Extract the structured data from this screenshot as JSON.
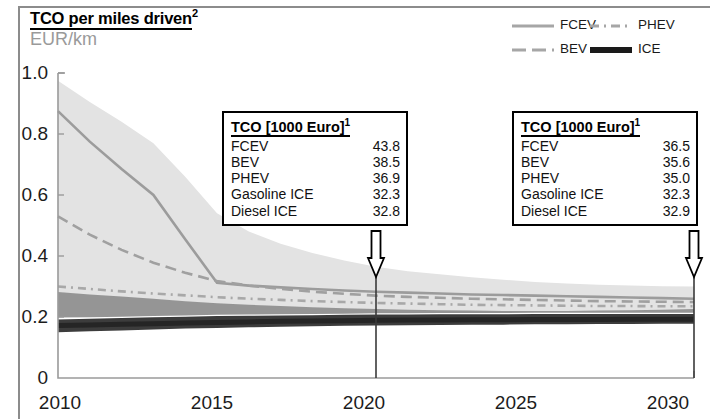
{
  "header": {
    "title": "TCO per miles driven",
    "title_superscript": "2",
    "subtitle": "EUR/km"
  },
  "legend": {
    "items": [
      {
        "label": "FCEV",
        "style": "solid",
        "color": "#a6a6a6",
        "icon": "line-solid-icon"
      },
      {
        "label": "PHEV",
        "style": "dash-dot",
        "color": "#a6a6a6",
        "icon": "line-dash-dot-icon"
      },
      {
        "label": "BEV",
        "style": "dashed",
        "color": "#a6a6a6",
        "icon": "line-dashed-icon"
      },
      {
        "label": "ICE",
        "style": "solid-thick",
        "color": "#1a1a1a",
        "icon": "line-thick-icon"
      }
    ]
  },
  "callouts": [
    {
      "id": "callout-2020",
      "title": "TCO [1000 Euro]",
      "title_superscript": "1",
      "year": 2020,
      "rows": [
        {
          "name": "FCEV",
          "value": "43.8"
        },
        {
          "name": "BEV",
          "value": "38.5"
        },
        {
          "name": "PHEV",
          "value": "36.9"
        },
        {
          "name": "Gasoline ICE",
          "value": "32.3"
        },
        {
          "name": "Diesel ICE",
          "value": "32.8"
        }
      ]
    },
    {
      "id": "callout-2030",
      "title": "TCO [1000 Euro]",
      "title_superscript": "1",
      "year": 2030,
      "rows": [
        {
          "name": "FCEV",
          "value": "36.5"
        },
        {
          "name": "BEV",
          "value": "35.6"
        },
        {
          "name": "PHEV",
          "value": "35.0"
        },
        {
          "name": "Gasoline ICE",
          "value": "32.3"
        },
        {
          "name": "Diesel ICE",
          "value": "32.9"
        }
      ]
    }
  ],
  "chart_data": {
    "type": "line",
    "title": "TCO per miles driven",
    "xlabel": "",
    "ylabel": "EUR/km",
    "xlim": [
      2010,
      2030
    ],
    "ylim": [
      0,
      1.0
    ],
    "xticks": [
      2010,
      2015,
      2020,
      2025,
      2030
    ],
    "yticks": [
      "0",
      "0.2",
      "0.4",
      "0.6",
      "0.8",
      "1.0"
    ],
    "grid": false,
    "legend_position": "top-right",
    "x": [
      2010,
      2011,
      2012,
      2013,
      2014,
      2015,
      2016,
      2017,
      2018,
      2019,
      2020,
      2021,
      2022,
      2023,
      2024,
      2025,
      2026,
      2027,
      2028,
      2029,
      2030
    ],
    "series": [
      {
        "name": "FCEV",
        "style": "solid",
        "color": "#9c9c9c",
        "values": [
          0.875,
          0.775,
          0.685,
          0.6,
          0.455,
          0.312,
          0.303,
          0.297,
          0.292,
          0.287,
          0.283,
          0.28,
          0.277,
          0.274,
          0.272,
          0.27,
          0.268,
          0.266,
          0.264,
          0.262,
          0.26
        ],
        "band_upper": [
          0.975,
          0.905,
          0.84,
          0.77,
          0.66,
          0.54,
          0.48,
          0.44,
          0.41,
          0.385,
          0.365,
          0.35,
          0.34,
          0.33,
          0.322,
          0.315,
          0.31,
          0.306,
          0.303,
          0.301,
          0.3
        ],
        "band_lower": [
          0.28,
          0.272,
          0.265,
          0.258,
          0.25,
          0.243,
          0.238,
          0.234,
          0.23,
          0.227,
          0.224,
          0.222,
          0.22,
          0.219,
          0.218,
          0.218,
          0.218,
          0.219,
          0.22,
          0.222,
          0.224
        ]
      },
      {
        "name": "BEV",
        "style": "dashed",
        "color": "#a0a0a0",
        "values": [
          0.53,
          0.47,
          0.42,
          0.378,
          0.345,
          0.318,
          0.303,
          0.292,
          0.283,
          0.276,
          0.27,
          0.266,
          0.263,
          0.26,
          0.258,
          0.256,
          0.254,
          0.252,
          0.251,
          0.25,
          0.249
        ]
      },
      {
        "name": "PHEV",
        "style": "dash-dot",
        "color": "#a8a8a8",
        "values": [
          0.3,
          0.292,
          0.284,
          0.277,
          0.271,
          0.265,
          0.26,
          0.256,
          0.252,
          0.249,
          0.246,
          0.244,
          0.242,
          0.24,
          0.239,
          0.238,
          0.237,
          0.236,
          0.236,
          0.235,
          0.235
        ]
      },
      {
        "name": "ICE",
        "style": "solid-thick",
        "color": "#252525",
        "values": [
          0.172,
          0.174,
          0.176,
          0.178,
          0.18,
          0.182,
          0.184,
          0.186,
          0.187,
          0.188,
          0.189,
          0.19,
          0.19,
          0.191,
          0.191,
          0.192,
          0.192,
          0.192,
          0.193,
          0.193,
          0.193
        ],
        "band_upper": [
          0.192,
          0.194,
          0.197,
          0.199,
          0.201,
          0.203,
          0.204,
          0.205,
          0.206,
          0.207,
          0.208,
          0.208,
          0.209,
          0.209,
          0.209,
          0.21,
          0.21,
          0.21,
          0.21,
          0.21,
          0.21
        ],
        "band_lower": [
          0.15,
          0.153,
          0.156,
          0.159,
          0.162,
          0.164,
          0.166,
          0.168,
          0.17,
          0.171,
          0.172,
          0.173,
          0.174,
          0.175,
          0.175,
          0.176,
          0.176,
          0.177,
          0.177,
          0.178,
          0.178
        ]
      },
      {
        "name": "BEV/PHEV band",
        "style": "band",
        "color": "#8f8f8f",
        "band_upper": [
          0.282,
          0.274,
          0.267,
          0.26,
          0.252,
          0.245,
          0.24,
          0.236,
          0.232,
          0.229,
          0.226,
          0.224,
          0.222,
          0.221,
          0.22,
          0.22,
          0.22,
          0.221,
          0.222,
          0.224,
          0.226
        ],
        "band_lower": [
          0.198,
          0.199,
          0.201,
          0.203,
          0.205,
          0.207,
          0.208,
          0.209,
          0.21,
          0.211,
          0.212,
          0.212,
          0.213,
          0.213,
          0.213,
          0.214,
          0.214,
          0.214,
          0.214,
          0.214,
          0.214
        ]
      }
    ]
  },
  "markers": [
    {
      "id": "arrow-2020",
      "year": 2020,
      "icon": "down-arrow-icon"
    },
    {
      "id": "arrow-2030",
      "year": 2030,
      "icon": "down-arrow-icon"
    }
  ]
}
